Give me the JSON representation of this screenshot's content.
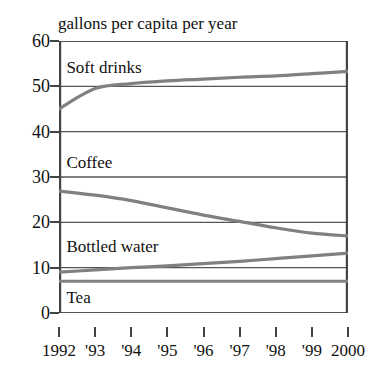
{
  "chart_data": {
    "type": "line",
    "title": "gallons per capita per year",
    "xlabel": "",
    "ylabel": "",
    "x": [
      1992,
      1993,
      1994,
      1995,
      1996,
      1997,
      1998,
      1999,
      2000
    ],
    "xtick_labels": [
      "1992",
      "'93",
      "'94",
      "'95",
      "'96",
      "'97",
      "'98",
      "'99",
      "2000"
    ],
    "ytick_labels": [
      "0",
      "10",
      "20",
      "30",
      "40",
      "50",
      "60"
    ],
    "yticks": [
      0,
      10,
      20,
      30,
      40,
      50,
      60
    ],
    "ylim": [
      0,
      60
    ],
    "xlim": [
      1992,
      2000
    ],
    "grid": true,
    "legend": "inline-labels",
    "series": [
      {
        "name": "Soft drinks",
        "values": [
          45.0,
          49.5,
          50.6,
          51.2,
          51.6,
          52.0,
          52.3,
          52.8,
          53.3
        ],
        "color": "#808080",
        "label_x": 1992.15,
        "label_y": 54.0
      },
      {
        "name": "Coffee",
        "values": [
          26.9,
          26.0,
          24.8,
          23.2,
          21.6,
          20.2,
          18.8,
          17.6,
          17.0
        ],
        "color": "#808080",
        "label_x": 1992.15,
        "label_y": 33.0
      },
      {
        "name": "Bottled water",
        "values": [
          9.0,
          9.5,
          10.0,
          10.4,
          10.9,
          11.4,
          12.0,
          12.6,
          13.2
        ],
        "color": "#808080",
        "label_x": 1992.15,
        "label_y": 14.5
      },
      {
        "name": "Tea",
        "values": [
          7.0,
          7.0,
          7.0,
          7.0,
          7.0,
          7.0,
          7.0,
          7.0,
          7.0
        ],
        "color": "#808080",
        "label_x": 1992.15,
        "label_y": 3.2
      }
    ],
    "axis_color": "#444444",
    "grid_color": "#555555"
  }
}
